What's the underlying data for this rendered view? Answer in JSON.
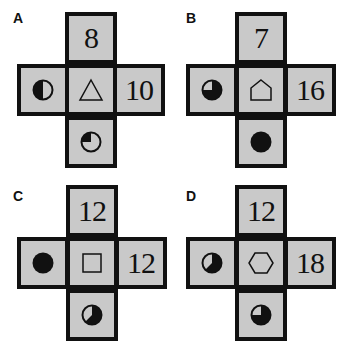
{
  "puzzle": {
    "colors": {
      "cell_fill": "#c9c9c9",
      "border": "#111111",
      "ink": "#111111",
      "background": "#ffffff"
    },
    "panels": [
      {
        "label": "A",
        "top": "8",
        "right": "10",
        "center_shape": "triangle",
        "left_circle": {
          "icon": "half-filled-circle-icon",
          "fill_fraction": 0.5,
          "filled_region": "left half"
        },
        "bottom_circle": {
          "icon": "quarter-filled-circle-icon",
          "fill_fraction": 0.25,
          "filled_region": "top-left quadrant"
        }
      },
      {
        "label": "B",
        "top": "7",
        "right": "16",
        "center_shape": "pentagon",
        "left_circle": {
          "icon": "three-quarter-filled-circle-icon",
          "fill_fraction": 0.75,
          "filled_region": "all but top-left quadrant"
        },
        "bottom_circle": {
          "icon": "full-filled-circle-icon",
          "fill_fraction": 1.0,
          "filled_region": "full"
        }
      },
      {
        "label": "C",
        "top": "12",
        "right": "12",
        "center_shape": "square",
        "left_circle": {
          "icon": "full-filled-circle-icon",
          "fill_fraction": 1.0,
          "filled_region": "full"
        },
        "bottom_circle": {
          "icon": "five-eighths-filled-circle-icon",
          "fill_fraction": 0.625,
          "filled_region": "all but upper-left wedge"
        }
      },
      {
        "label": "D",
        "top": "12",
        "right": "18",
        "center_shape": "hexagon",
        "left_circle": {
          "icon": "five-eighths-filled-circle-icon",
          "fill_fraction": 0.625,
          "filled_region": "all but upper-left wedge"
        },
        "bottom_circle": {
          "icon": "three-quarter-filled-circle-icon",
          "fill_fraction": 0.75,
          "filled_region": "all but top-left quadrant"
        }
      }
    ]
  }
}
